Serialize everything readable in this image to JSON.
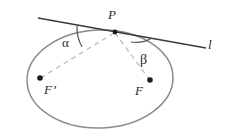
{
  "figure": {
    "type": "geometry-diagram",
    "background_color": "#ffffff",
    "labels": {
      "tangent_point": "P",
      "tangent_line": "l",
      "angle_left": "α",
      "angle_right": "β",
      "focus_left": "F’",
      "focus_right": "F"
    },
    "colors": {
      "ellipse_stroke": "#8a8a8a",
      "tangent_stroke": "#3a3a3a",
      "dashed_stroke": "#b9b9b9",
      "arc_stroke": "#555555",
      "point_fill": "#1a1a1a",
      "text": "#2b2b2b"
    },
    "geometry": {
      "ellipse_center": [
        100,
        79
      ],
      "ellipse_radius_x": 73,
      "ellipse_radius_y": 49,
      "tangent_point_xy": [
        115,
        32
      ],
      "tangent_start_xy": [
        38,
        18
      ],
      "tangent_end_xy": [
        206,
        48
      ],
      "focus_left_xy": [
        40,
        78
      ],
      "focus_right_xy": [
        150,
        80
      ]
    }
  }
}
